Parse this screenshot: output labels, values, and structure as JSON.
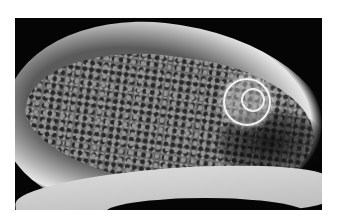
{
  "image": {
    "description": "Grayscale specimen radiograph showing an elongated bone-like structure with trabecular texture and a bright circular multilobed lesion on the right",
    "background_color": "#ffffff",
    "photo_bg_color": "#050505"
  }
}
